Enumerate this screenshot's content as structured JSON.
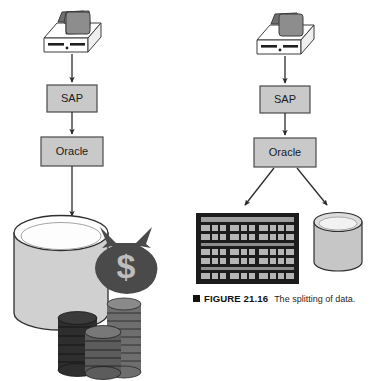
{
  "figure": {
    "caption_bullet": "■",
    "caption_label": "FIGURE 21.16",
    "caption_text": "The splitting of data."
  },
  "colors": {
    "box_fill": "#c9c9c9",
    "box_stroke": "#4a4a4a",
    "arrow": "#2b2b2b",
    "computer_case_fill": "#ffffff",
    "computer_monitor_fill": "#8f8f8f",
    "cylinder_fill": "#d0d0d0",
    "cylinder_top_fill": "#fdfdfd",
    "small_cylinder_fill": "#c6c6c6",
    "money_bag_fill": "#4a4a4a",
    "dollar_sign_fill": "#bdbdbd",
    "coin_dark": "#2e2e2e",
    "coin_mid": "#6e6e6e",
    "grid_bg": "#1c1c1c",
    "grid_cell": "#b5b5b5",
    "page_bg": "#ffffff",
    "caption_color": "#111111"
  },
  "left_flow": {
    "name": "unsplit-data-flow",
    "source_icon": "desktop-computer-icon",
    "steps": [
      {
        "label": "SAP"
      },
      {
        "label": "Oracle"
      }
    ],
    "destination_icon": "large-database-cylinder-with-money",
    "money_symbol": "$",
    "coin_stacks": 3
  },
  "right_flow": {
    "name": "split-data-flow",
    "source_icon": "desktop-computer-icon",
    "steps": [
      {
        "label": "SAP"
      },
      {
        "label": "Oracle"
      }
    ],
    "destinations": [
      {
        "icon": "data-grid-table-icon"
      },
      {
        "icon": "database-cylinder-icon"
      }
    ]
  }
}
